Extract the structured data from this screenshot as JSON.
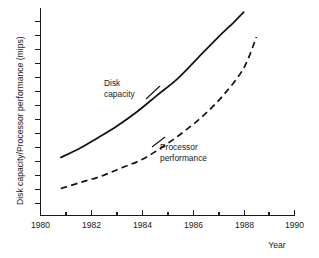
{
  "chart_data": {
    "type": "line",
    "title": "",
    "subtitle": "",
    "xlabel": "Year",
    "ylabel": "Disk capacity/Processor performance (mips)",
    "xlim": [
      1980,
      1990
    ],
    "ylim": [
      0,
      100
    ],
    "grid": false,
    "legend_position": "inline-annotations",
    "x_major_ticks": [
      1980,
      1982,
      1984,
      1986,
      1988,
      1990
    ],
    "x_major_tick_labels": [
      "1980",
      "1982",
      "1984",
      "1986",
      "1988",
      "1990"
    ],
    "x_minor_ticks": [
      1981,
      1983,
      1985,
      1987,
      1989
    ],
    "y_tick_labels": [],
    "y_tick_count": 14,
    "series": [
      {
        "name": "Disk capacity",
        "style": "solid",
        "color": "#111111",
        "label_lines": [
          "Disk",
          "capacity"
        ],
        "x": [
          1980.8,
          1981.5,
          1982.2,
          1983.0,
          1983.8,
          1984.6,
          1985.4,
          1986.2,
          1987.0,
          1987.6,
          1988.0
        ],
        "y": [
          28,
          32,
          37,
          43,
          50,
          58,
          66,
          76,
          86,
          93,
          98
        ]
      },
      {
        "name": "Processor performance",
        "style": "dashed",
        "color": "#111111",
        "label_lines": [
          "Processor",
          "performance"
        ],
        "x": [
          1980.8,
          1981.6,
          1982.4,
          1983.2,
          1984.0,
          1984.8,
          1985.6,
          1986.4,
          1987.2,
          1988.0,
          1988.5
        ],
        "y": [
          13,
          16,
          19,
          23,
          27,
          33,
          40,
          48,
          58,
          71,
          86
        ]
      }
    ],
    "annotations": [
      {
        "text": "Disk capacity",
        "x": 1982.5,
        "y": 66
      },
      {
        "text": "Processor performance",
        "x": 1985.2,
        "y": 34
      }
    ]
  },
  "axes": {
    "y_axis_title": "Disk capacity/Processor performance (mips)",
    "x_axis_title": "Year",
    "x_labels": {
      "l1980": "1980",
      "l1982": "1982",
      "l1984": "1984",
      "l1986": "1986",
      "l1988": "1988",
      "l1990": "1990"
    }
  },
  "series_labels": {
    "disk_line1": "Disk",
    "disk_line2": "capacity",
    "proc_line1": "Processor",
    "proc_line2": "performance"
  },
  "colors": {
    "ink": "#111111",
    "background": "#ffffff"
  }
}
